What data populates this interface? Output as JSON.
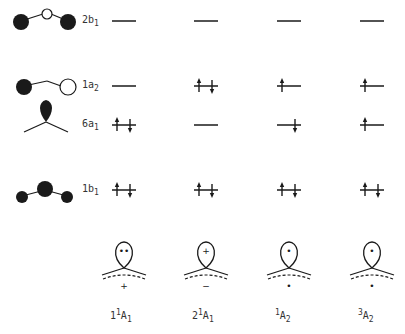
{
  "orbitals": [
    {
      "id": "2b1",
      "name": "2b",
      "sub": "1",
      "y": 21
    },
    {
      "id": "1a2",
      "name": "1a",
      "sub": "2",
      "y": 86
    },
    {
      "id": "6a1",
      "name": "6a",
      "sub": "1",
      "y": 125
    },
    {
      "id": "1b1",
      "name": "1b",
      "sub": "1",
      "y": 190
    }
  ],
  "states": [
    {
      "pre": "1",
      "sup": "1",
      "main": "A",
      "sub": "1",
      "x": 124,
      "occupancy": {
        "2b1": "empty",
        "1a2": "empty",
        "6a1": "paired",
        "1b1": "paired"
      },
      "lobe_mark": "••",
      "below_mark": "+"
    },
    {
      "pre": "2",
      "sup": "1",
      "main": "A",
      "sub": "1",
      "x": 206,
      "occupancy": {
        "2b1": "empty",
        "1a2": "paired",
        "6a1": "empty",
        "1b1": "paired"
      },
      "lobe_mark": "+",
      "below_mark": "−"
    },
    {
      "pre": "",
      "sup": "1",
      "main": "A",
      "sub": "2",
      "x": 289,
      "occupancy": {
        "2b1": "empty",
        "1a2": "up",
        "6a1": "down",
        "1b1": "paired"
      },
      "lobe_mark": "•",
      "below_mark": "•"
    },
    {
      "pre": "",
      "sup": "3",
      "main": "A",
      "sub": "2",
      "x": 372,
      "occupancy": {
        "2b1": "empty",
        "1a2": "up",
        "6a1": "up",
        "1b1": "paired"
      },
      "lobe_mark": "•",
      "below_mark": "•"
    }
  ],
  "colors": {
    "ink": "#1a1a1a",
    "background": "#ffffff"
  }
}
